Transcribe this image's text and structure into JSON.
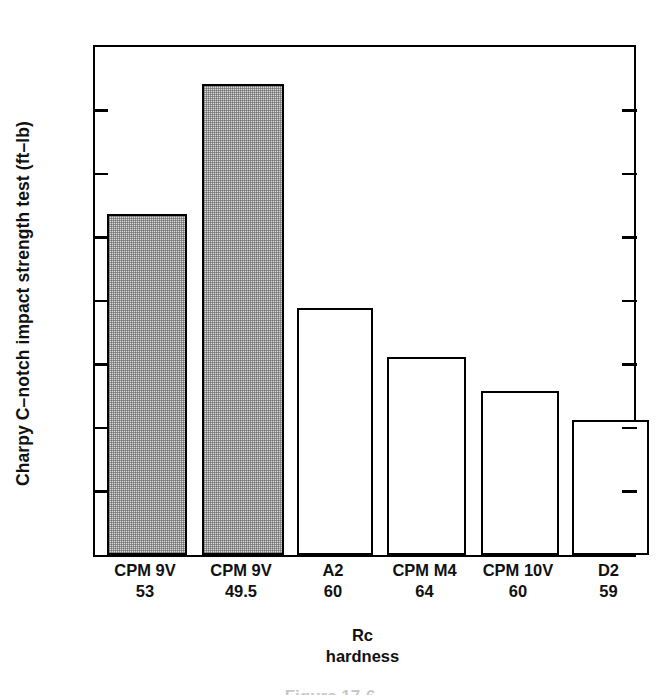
{
  "chart_data": {
    "type": "bar",
    "title": "",
    "xlabel": "Rc hardness",
    "ylabel": "Charpy C–notch impact strength test (ft–lb)",
    "ylim": [
      0,
      80
    ],
    "yticks": [
      0,
      10,
      20,
      30,
      40,
      50,
      60,
      70,
      80
    ],
    "ytick_labels": [
      "0",
      "10",
      "20",
      "30",
      "40",
      "50",
      "60",
      "70",
      "80"
    ],
    "grid": false,
    "legend": "none",
    "categories": [
      "CPM 9V 53",
      "CPM 9V 49.5",
      "A2 60",
      "CPM M4 64",
      "CPM 10V 60",
      "D2 59"
    ],
    "values": [
      53.7,
      74.1,
      38.9,
      31.2,
      25.8,
      21.3
    ],
    "bars": [
      {
        "material": "CPM 9V",
        "hardness": "53",
        "value": 53.7,
        "fill": "shaded"
      },
      {
        "material": "CPM 9V",
        "hardness": "49.5",
        "value": 74.1,
        "fill": "shaded"
      },
      {
        "material": "A2",
        "hardness": "60",
        "value": 38.9,
        "fill": "open"
      },
      {
        "material": "CPM M4",
        "hardness": "64",
        "value": 31.2,
        "fill": "open"
      },
      {
        "material": "CPM 10V",
        "hardness": "60",
        "value": 25.8,
        "fill": "open"
      },
      {
        "material": "D2",
        "hardness": "59",
        "value": 21.3,
        "fill": "open"
      }
    ]
  },
  "axis": {
    "y_title": "Charpy C–notch impact strength test (ft–lb)",
    "x_title_line1": "Rc",
    "x_title_line2": "hardness"
  },
  "colors": {
    "axis": "#000000",
    "bar_outline": "#000000",
    "bar_open_fill": "#ffffff",
    "bar_shaded_fill": "#d9d9d9",
    "background": "#ffffff"
  },
  "caption": {
    "text": "Figure  17-6"
  }
}
